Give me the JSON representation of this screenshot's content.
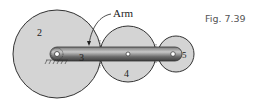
{
  "figure": {
    "caption": "Fig. 7.39",
    "type": "planetary gear train with arm",
    "labels": {
      "arm": "Arm",
      "gear_2": "2",
      "arm_link": "3",
      "gear_4": "4",
      "gear_5": "5"
    },
    "colors": {
      "gear_fill": "#d4d4d4",
      "gear_stroke": "#333333",
      "arm_dark": "#555555",
      "arm_light": "#bdbdbd",
      "caption": "#555555"
    }
  }
}
